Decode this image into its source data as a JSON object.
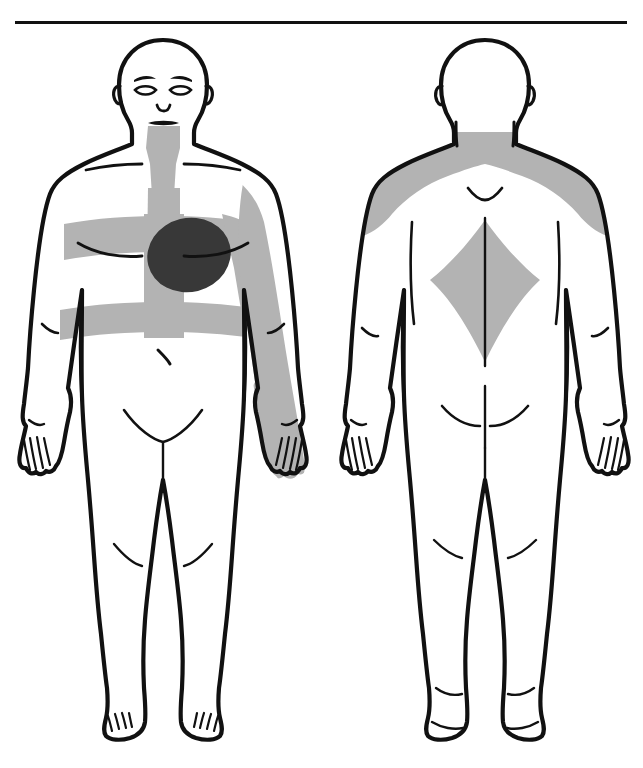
{
  "document": {
    "title": "Body Pain Distribution Diagram",
    "top_rule": true,
    "scan_artifact_text": "",
    "background_color": "#ffffff"
  },
  "palette": {
    "outline": "#111111",
    "paper": "#ffffff",
    "shading_light": "#b3b3b3",
    "shading_dark": "#383838"
  },
  "figures": [
    {
      "id": "front",
      "view_label": "Front view",
      "has_face": true,
      "facial_features": [
        "eyebrows",
        "eyes",
        "nose",
        "mouth",
        "ears"
      ],
      "body_marks": [
        "clavicles",
        "breast-fold-lines",
        "navel",
        "elbow-creases",
        "knee-creases",
        "groin-lines",
        "finger-lines",
        "toe-lines"
      ],
      "pain_regions": [
        {
          "name": "precordial-core",
          "label": "Precordial core (left chest / heart area)",
          "intensity": "severe",
          "shade": "#383838"
        },
        {
          "name": "sternal-band",
          "label": "Central sternal band (neck to epigastrium)",
          "intensity": "moderate",
          "shade": "#b3b3b3"
        },
        {
          "name": "chest-band",
          "label": "Horizontal chest band across pectorals",
          "intensity": "moderate",
          "shade": "#b3b3b3"
        },
        {
          "name": "upper-abdomen-band",
          "label": "Upper abdominal / epigastric band",
          "intensity": "moderate",
          "shade": "#b3b3b3"
        },
        {
          "name": "left-arm-radiation",
          "label": "Left arm medial radiation to hand",
          "intensity": "moderate",
          "shade": "#b3b3b3"
        },
        {
          "name": "anterior-neck",
          "label": "Anterior neck / throat",
          "intensity": "moderate",
          "shade": "#b3b3b3"
        }
      ]
    },
    {
      "id": "back",
      "view_label": "Back view",
      "has_face": false,
      "facial_features": [],
      "body_marks": [
        "ears",
        "nape-v-mark",
        "spine-line",
        "scapula-lines",
        "gluteal-crease",
        "elbow-creases",
        "knee-creases",
        "heel-lines"
      ],
      "pain_regions": [
        {
          "name": "shoulder-yoke",
          "label": "Shoulder yoke across trapezius and upper back",
          "intensity": "moderate",
          "shade": "#b3b3b3"
        },
        {
          "name": "interscapular-diamond",
          "label": "Interscapular diamond (mid-back)",
          "intensity": "moderate",
          "shade": "#b3b3b3"
        },
        {
          "name": "posterior-neck-base",
          "label": "Posterior neck base",
          "intensity": "moderate",
          "shade": "#b3b3b3"
        }
      ]
    }
  ]
}
